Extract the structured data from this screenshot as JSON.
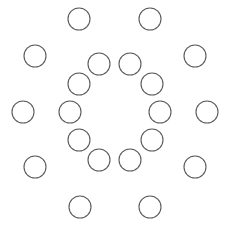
{
  "figure": {
    "background_color": "#ffffff",
    "canvas": {
      "width": 231,
      "height": 231
    },
    "center": {
      "x": 115,
      "y": 112
    },
    "stroke_color": "#5a5a5a",
    "stroke_width": 1.1,
    "fill": "none",
    "total_circles": 20
  },
  "chart_data": {
    "type": "scatter",
    "subtitle": "",
    "xlabel": "",
    "ylabel": "",
    "xlim": [
      0,
      231
    ],
    "ylim": [
      0,
      231
    ],
    "grid": false,
    "legend": "none",
    "marker": "open-circle",
    "marker_radius": 11,
    "series": [
      {
        "name": "outer-ring",
        "count": 10,
        "ring_radius": 93,
        "center": {
          "x": 115,
          "y": 112
        },
        "points": [
          {
            "id": "outer-1",
            "x": 79,
            "y": 19,
            "angle_deg": 108
          },
          {
            "id": "outer-2",
            "x": 150,
            "y": 19,
            "angle_deg": 72
          },
          {
            "id": "outer-3",
            "x": 35,
            "y": 56,
            "angle_deg": 144
          },
          {
            "id": "outer-4",
            "x": 195,
            "y": 56,
            "angle_deg": 36
          },
          {
            "id": "outer-5",
            "x": 23,
            "y": 112,
            "angle_deg": 180
          },
          {
            "id": "outer-6",
            "x": 207,
            "y": 112,
            "angle_deg": 0
          },
          {
            "id": "outer-7",
            "x": 35,
            "y": 167,
            "angle_deg": 216
          },
          {
            "id": "outer-8",
            "x": 195,
            "y": 167,
            "angle_deg": 324
          },
          {
            "id": "outer-9",
            "x": 80,
            "y": 207,
            "angle_deg": 252
          },
          {
            "id": "outer-10",
            "x": 150,
            "y": 207,
            "angle_deg": 288
          }
        ]
      },
      {
        "name": "inner-ring",
        "count": 10,
        "ring_radius": 48,
        "center": {
          "x": 115,
          "y": 112
        },
        "points": [
          {
            "id": "inner-1",
            "x": 99,
            "y": 64,
            "angle_deg": 108
          },
          {
            "id": "inner-2",
            "x": 130,
            "y": 64,
            "angle_deg": 72
          },
          {
            "id": "inner-3",
            "x": 79,
            "y": 84,
            "angle_deg": 144
          },
          {
            "id": "inner-4",
            "x": 152,
            "y": 84,
            "angle_deg": 36
          },
          {
            "id": "inner-5",
            "x": 70,
            "y": 112,
            "angle_deg": 180
          },
          {
            "id": "inner-6",
            "x": 160,
            "y": 112,
            "angle_deg": 0
          },
          {
            "id": "inner-7",
            "x": 79,
            "y": 140,
            "angle_deg": 216
          },
          {
            "id": "inner-8",
            "x": 152,
            "y": 140,
            "angle_deg": 324
          },
          {
            "id": "inner-9",
            "x": 99,
            "y": 160,
            "angle_deg": 252
          },
          {
            "id": "inner-10",
            "x": 130,
            "y": 160,
            "angle_deg": 288
          }
        ]
      }
    ]
  }
}
